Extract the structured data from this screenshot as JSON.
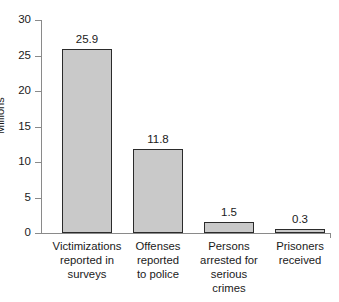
{
  "chart_data": {
    "type": "bar",
    "title": "",
    "xlabel": "",
    "ylabel": "Millions",
    "ylim": [
      0,
      30
    ],
    "yticks": [
      0,
      5,
      10,
      15,
      20,
      25,
      30
    ],
    "ytick_labels": [
      "0",
      "5",
      "10",
      "15",
      "20",
      "25",
      "30"
    ],
    "grid": false,
    "legend": null,
    "categories": [
      "Victimizations\nreported in\nsurveys",
      "Offenses\nreported\nto police",
      "Persons\narrested for\nserious\ncrimes",
      "Prisoners\nreceived"
    ],
    "values": [
      25.9,
      11.8,
      1.5,
      0.3
    ],
    "value_labels": [
      "25.9",
      "11.8",
      "1.5",
      "0.3"
    ],
    "colors": {
      "bar_fill": "#c9c9c9",
      "bar_border": "#2b2b2b",
      "axis": "#8a8a8a",
      "text": "#1a1a1a",
      "background": "#ffffff"
    }
  }
}
